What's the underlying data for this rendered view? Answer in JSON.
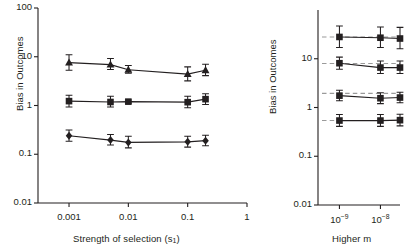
{
  "figure": {
    "background": "#ffffff",
    "ink": "#231f20",
    "dash_color": "#9a9a9a"
  },
  "chart_data": [
    {
      "type": "scatter",
      "panel": "left",
      "title": "",
      "xlabel": "Strength of selection (s1)",
      "xlabel_main": "Strength of selection (s",
      "xlabel_sub": "1",
      "xlabel_tail": ")",
      "ylabel": "Bias in Outcomes",
      "xscale": "log",
      "yscale": "log",
      "xlim": [
        0.0003,
        1.0
      ],
      "ylim": [
        0.01,
        100
      ],
      "xticks": [
        0.001,
        0.01,
        0.1,
        1
      ],
      "xticklabels": [
        "0.001",
        "0.01",
        "0.1",
        "1"
      ],
      "yticks": [
        0.01,
        0.1,
        1,
        10,
        100
      ],
      "yticklabels": [
        "0.01",
        "0.1",
        "1",
        "10",
        "100"
      ],
      "grid": false,
      "legend": "none",
      "x": [
        0.001,
        0.005,
        0.01,
        0.1,
        0.2
      ],
      "series": [
        {
          "name": "upper",
          "marker": "triangle",
          "values": [
            7.6,
            6.9,
            5.4,
            4.4,
            5.3
          ],
          "err_low": [
            5.3,
            5.5,
            4.6,
            3.2,
            4.1
          ],
          "err_high": [
            11.0,
            9.2,
            6.6,
            6.2,
            7.0
          ]
        },
        {
          "name": "middle",
          "marker": "square",
          "values": [
            1.23,
            1.18,
            1.2,
            1.17,
            1.35
          ],
          "err_low": [
            0.93,
            0.93,
            1.12,
            0.9,
            1.05
          ],
          "err_high": [
            1.62,
            1.55,
            1.3,
            1.55,
            1.75
          ]
        },
        {
          "name": "lower",
          "marker": "diamond",
          "values": [
            0.24,
            0.195,
            0.175,
            0.18,
            0.19
          ],
          "err_low": [
            0.185,
            0.155,
            0.135,
            0.14,
            0.15
          ],
          "err_high": [
            0.315,
            0.255,
            0.235,
            0.235,
            0.245
          ]
        }
      ]
    },
    {
      "type": "scatter",
      "panel": "right",
      "title": "",
      "xlabel": "Higher m",
      "ylabel": "Bias in Outcomes",
      "xscale": "log",
      "yscale": "log",
      "xlim": [
        3e-10,
        3e-08
      ],
      "ylim": [
        0.01,
        100
      ],
      "xticks": [
        1e-09,
        1e-08
      ],
      "xticklabels": [
        "10-9",
        "10-8"
      ],
      "xtick_base": "10",
      "xtick_exponents": [
        "−9",
        "−8"
      ],
      "yticks": [
        0.01,
        0.1,
        1,
        10
      ],
      "yticklabels": [
        "0.01",
        "0.1",
        "1",
        "10"
      ],
      "grid": false,
      "legend": "none",
      "reference_lines": [
        28.0,
        8.0,
        1.95,
        0.54
      ],
      "x": [
        1e-09,
        1e-08,
        3e-08
      ],
      "series": [
        {
          "name": "s1",
          "marker": "square",
          "values": [
            28.0,
            27.0,
            26.0
          ],
          "err_low": [
            17.0,
            17.0,
            16.0
          ],
          "err_high": [
            47.0,
            45.0,
            44.0
          ]
        },
        {
          "name": "s2",
          "marker": "square",
          "values": [
            8.1,
            6.6,
            6.6
          ],
          "err_low": [
            6.1,
            5.0,
            5.0
          ],
          "err_high": [
            10.8,
            9.0,
            9.0
          ]
        },
        {
          "name": "s3",
          "marker": "square",
          "values": [
            1.75,
            1.55,
            1.6
          ],
          "err_low": [
            1.38,
            1.2,
            1.25
          ],
          "err_high": [
            2.25,
            2.0,
            2.05
          ]
        },
        {
          "name": "s4",
          "marker": "square",
          "values": [
            0.54,
            0.54,
            0.55
          ],
          "err_low": [
            0.41,
            0.41,
            0.42
          ],
          "err_high": [
            0.72,
            0.72,
            0.73
          ]
        }
      ]
    }
  ]
}
